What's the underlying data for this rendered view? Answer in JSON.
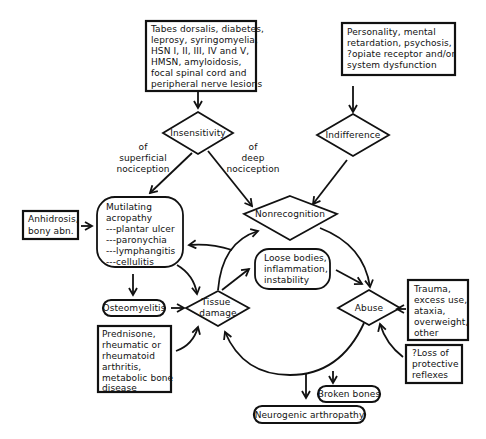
{
  "diagram": {
    "causes_box": {
      "lines": [
        "Tabes dorsalis, diabetes,",
        "leprosy, syringomyelia,",
        "HSN I, II, III, IV and V,",
        "HMSN, amyloidosis,",
        "focal spinal cord and",
        "peripheral nerve lesions"
      ]
    },
    "personality_box": {
      "lines": [
        "Personality, mental",
        "retardation, psychosis,",
        "?opiate receptor and/or",
        "system dysfunction"
      ]
    },
    "insensitivity": {
      "label": "Insensitivity"
    },
    "indifference": {
      "label": "Indifference"
    },
    "superficial_label": {
      "lines": [
        "of",
        "superficial",
        "nociception"
      ]
    },
    "deep_label": {
      "lines": [
        "of",
        "deep",
        "nociception"
      ]
    },
    "nonrecognition": {
      "label": "Nonrecognition"
    },
    "anhidrosis_box": {
      "lines": [
        "Anhidrosis,",
        "bony abn."
      ]
    },
    "mutilating_box": {
      "lines": [
        "Mutilating",
        "acropathy",
        "---plantar ulcer",
        "---paronychia",
        "---lymphangitis",
        "---cellulitis"
      ]
    },
    "loose_bodies": {
      "lines": [
        "Loose bodies,",
        "inflammation,",
        "instability"
      ]
    },
    "osteomyelitis": {
      "label": "Osteomyelitis"
    },
    "tissue_damage": {
      "lines": [
        "Tissue",
        "damage"
      ]
    },
    "abuse": {
      "label": "Abuse"
    },
    "trauma_box": {
      "lines": [
        "Trauma,",
        "excess use,",
        "ataxia,",
        "overweight,",
        "other"
      ]
    },
    "loss_reflexes_box": {
      "lines": [
        "?Loss of",
        "protective",
        "reflexes"
      ]
    },
    "prednisone_box": {
      "lines": [
        "Prednisone,",
        "rheumatic or",
        "rheumatoid",
        "arthritis,",
        "metabolic bone",
        "disease"
      ]
    },
    "broken_bones": {
      "label": "Broken bones"
    },
    "neurogenic": {
      "label": "Neurogenic arthropathy"
    }
  }
}
